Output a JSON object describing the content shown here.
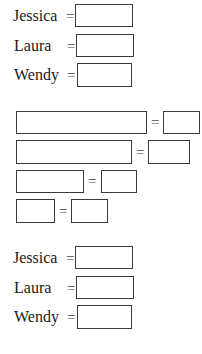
{
  "top_section": {
    "rows": [
      {
        "name": "Jessica",
        "equals": "="
      },
      {
        "name": "Laura",
        "equals": "="
      },
      {
        "name": "Wendy",
        "equals": "="
      }
    ]
  },
  "middle_section": {
    "rows": [
      {
        "equals": "="
      },
      {
        "equals": "="
      },
      {
        "equals": "="
      },
      {
        "equals": "="
      }
    ]
  },
  "bottom_section": {
    "rows": [
      {
        "name": "Jessica",
        "equals": "="
      },
      {
        "name": "Laura",
        "equals": "="
      },
      {
        "name": "Wendy",
        "equals": "="
      }
    ]
  }
}
